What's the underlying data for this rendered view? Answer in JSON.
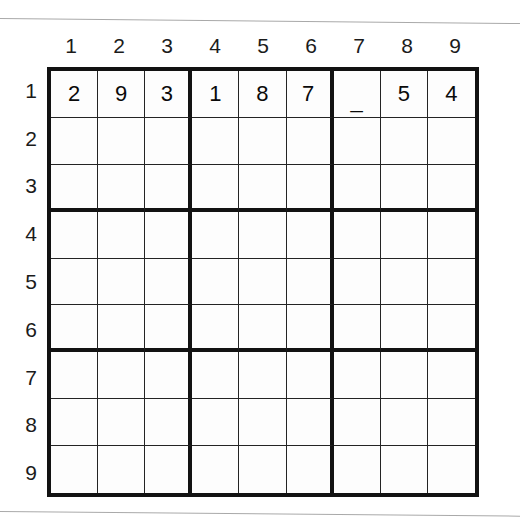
{
  "page": {
    "background_color": "#ffffff",
    "scan_line_color": "#a9a9a9"
  },
  "grid": {
    "size": 9,
    "box_size": 3,
    "border_color": "#121212",
    "cell_line_color": "#242424",
    "cell_background": "#fdfdfd",
    "digit_color": "#0a0a0a",
    "header_color": "#1b1b1b",
    "column_headers": [
      "1",
      "2",
      "3",
      "4",
      "5",
      "6",
      "7",
      "8",
      "9"
    ],
    "row_headers": [
      "1",
      "2",
      "3",
      "4",
      "5",
      "6",
      "7",
      "8",
      "9"
    ],
    "cells": [
      [
        "2",
        "9",
        "3",
        "1",
        "8",
        "7",
        "_",
        "5",
        "4"
      ],
      [
        "",
        "",
        "",
        "",
        "",
        "",
        "",
        "",
        ""
      ],
      [
        "",
        "",
        "",
        "",
        "",
        "",
        "",
        "",
        ""
      ],
      [
        "",
        "",
        "",
        "",
        "",
        "",
        "",
        "",
        ""
      ],
      [
        "",
        "",
        "",
        "",
        "",
        "",
        "",
        "",
        ""
      ],
      [
        "",
        "",
        "",
        "",
        "",
        "",
        "",
        "",
        ""
      ],
      [
        "",
        "",
        "",
        "",
        "",
        "",
        "",
        "",
        ""
      ],
      [
        "",
        "",
        "",
        "",
        "",
        "",
        "",
        "",
        ""
      ],
      [
        "",
        "",
        "",
        "",
        "",
        "",
        "",
        "",
        ""
      ]
    ]
  }
}
